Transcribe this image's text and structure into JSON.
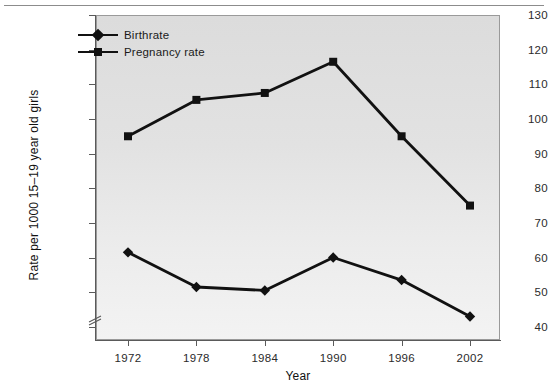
{
  "chart_data": {
    "type": "line",
    "title": "",
    "xlabel": "Year",
    "ylabel": "Rate per 1000 15–19 year old girls",
    "categories": [
      "1972",
      "1978",
      "1984",
      "1990",
      "1996",
      "2002"
    ],
    "x": [
      1972,
      1978,
      1984,
      1990,
      1996,
      2002
    ],
    "series": [
      {
        "name": "Birthrate",
        "marker": "diamond",
        "color": "#111111",
        "values": [
          61.5,
          51.5,
          50.5,
          60.0,
          53.5,
          43.0
        ]
      },
      {
        "name": "Pregnancy rate",
        "marker": "square",
        "color": "#111111",
        "values": [
          95.0,
          105.5,
          107.5,
          116.5,
          95.0,
          75.0
        ]
      }
    ],
    "ylim": [
      35,
      130
    ],
    "yticks": [
      40,
      50,
      60,
      70,
      80,
      90,
      100,
      110,
      120,
      130
    ],
    "ytick_labels": [
      "40",
      "50",
      "60",
      "70",
      "80",
      "90",
      "100",
      "110",
      "120",
      "130"
    ],
    "xtick_labels": [
      "1972",
      "1978",
      "1984",
      "1990",
      "1996",
      "2002"
    ],
    "axis_break": true,
    "axis_break_note": "y-axis break below 40",
    "grid": false,
    "legend_position": "top-left",
    "plot_background": "#e6e6e6",
    "plot_border_color": "#9a9a9a"
  },
  "legend": {
    "entries": [
      {
        "label": "Birthrate"
      },
      {
        "label": "Pregnancy rate"
      }
    ]
  },
  "axes": {
    "y_title": "Rate per 1000 15–19 year old girls",
    "x_title": "Year"
  }
}
